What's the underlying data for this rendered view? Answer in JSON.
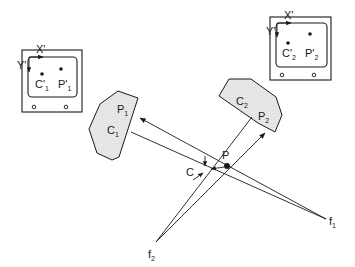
{
  "diagram": {
    "colors": {
      "ink": "#1a1a1a",
      "stipple": "#bdbdbd",
      "background": "#ffffff"
    },
    "camera_1": {
      "x_axis_label": "X'",
      "y_axis_label": "Y'",
      "points": [
        {
          "name": "C'",
          "sub": "1"
        },
        {
          "name": "P'",
          "sub": "1"
        }
      ]
    },
    "camera_2": {
      "x_axis_label": "X'",
      "y_axis_label": "Y'",
      "points": [
        {
          "name": "C'",
          "sub": "2"
        },
        {
          "name": "P'",
          "sub": "2"
        }
      ]
    },
    "image_plane_1": {
      "labels": [
        {
          "name": "P",
          "sub": "1"
        },
        {
          "name": "C",
          "sub": "1"
        }
      ]
    },
    "image_plane_2": {
      "labels": [
        {
          "name": "C",
          "sub": "2"
        },
        {
          "name": "P",
          "sub": "2"
        }
      ]
    },
    "scene_points": {
      "P": "P",
      "C": "C"
    },
    "focal_points": [
      {
        "name": "f",
        "sub": "1"
      },
      {
        "name": "f",
        "sub": "2"
      }
    ]
  }
}
